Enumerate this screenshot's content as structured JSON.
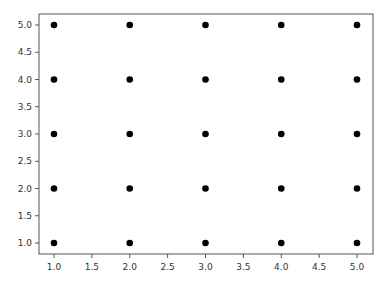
{
  "chart_data": {
    "type": "scatter",
    "title": "",
    "xlabel": "",
    "ylabel": "",
    "xlim": [
      0.8,
      5.2
    ],
    "ylim": [
      0.8,
      5.2
    ],
    "grid": false,
    "legend": null,
    "marker_color": "#000000",
    "x_ticks": [
      "1.0",
      "1.5",
      "2.0",
      "2.5",
      "3.0",
      "3.5",
      "4.0",
      "4.5",
      "5.0"
    ],
    "y_ticks": [
      "1.0",
      "1.5",
      "2.0",
      "2.5",
      "3.0",
      "3.5",
      "4.0",
      "4.5",
      "5.0"
    ],
    "points": [
      {
        "x": 1,
        "y": 1
      },
      {
        "x": 2,
        "y": 1
      },
      {
        "x": 3,
        "y": 1
      },
      {
        "x": 4,
        "y": 1
      },
      {
        "x": 5,
        "y": 1
      },
      {
        "x": 1,
        "y": 2
      },
      {
        "x": 2,
        "y": 2
      },
      {
        "x": 3,
        "y": 2
      },
      {
        "x": 4,
        "y": 2
      },
      {
        "x": 5,
        "y": 2
      },
      {
        "x": 1,
        "y": 3
      },
      {
        "x": 2,
        "y": 3
      },
      {
        "x": 3,
        "y": 3
      },
      {
        "x": 4,
        "y": 3
      },
      {
        "x": 5,
        "y": 3
      },
      {
        "x": 1,
        "y": 4
      },
      {
        "x": 2,
        "y": 4
      },
      {
        "x": 3,
        "y": 4
      },
      {
        "x": 4,
        "y": 4
      },
      {
        "x": 5,
        "y": 4
      },
      {
        "x": 1,
        "y": 5
      },
      {
        "x": 2,
        "y": 5
      },
      {
        "x": 3,
        "y": 5
      },
      {
        "x": 4,
        "y": 5
      },
      {
        "x": 5,
        "y": 5
      }
    ]
  }
}
